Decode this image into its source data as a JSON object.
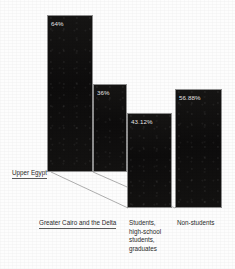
{
  "chart_data": {
    "type": "bar",
    "title": "",
    "subtitle": "",
    "xlabel": "",
    "ylabel": "",
    "grid": false,
    "legend": "none",
    "ylim": [
      0,
      70
    ],
    "categories": [
      "Upper Egypt",
      "Greater Cairo and the Delta",
      "Students, high-school students, graduates",
      "Non-students"
    ],
    "values": [
      64,
      36,
      43.12,
      56.88
    ],
    "value_labels": [
      "64%",
      "36%",
      "43.12%",
      "56.88%"
    ],
    "annotations": [
      "Upper Egypt and Greater Cairo and the Delta share a common baseline",
      "Students and Non-students share a common baseline"
    ]
  },
  "bars": [
    {
      "id": "upper-egypt",
      "value_label": "64%",
      "category": "Upper Egypt",
      "x": 47,
      "y": 15,
      "w": 46,
      "h": 157,
      "label_x": 51,
      "label_y": 20
    },
    {
      "id": "greater-cairo-delta",
      "value_label": "36%",
      "category": "Greater Cairo and the Delta",
      "x": 93,
      "y": 84,
      "w": 34,
      "h": 88,
      "label_x": 97,
      "label_y": 89
    },
    {
      "id": "students",
      "value_label": "43.12%",
      "category": "Students, high-school students, graduates",
      "x": 127,
      "y": 113,
      "w": 45,
      "h": 95,
      "label_x": 131,
      "label_y": 118
    },
    {
      "id": "non-students",
      "value_label": "56.88%",
      "category": "Non-students",
      "x": 175,
      "y": 89,
      "w": 47,
      "h": 119,
      "label_x": 179,
      "label_y": 94
    }
  ],
  "category_labels": [
    {
      "id": "upper-egypt",
      "text": "Upper Egypt",
      "x": 12,
      "y": 169,
      "underlined": true,
      "multiline": false
    },
    {
      "id": "greater-cairo-delta",
      "text": "Greater Cairo and the Delta",
      "x": 39,
      "y": 219,
      "underlined": true,
      "multiline": false
    },
    {
      "id": "students",
      "text": "Students, high-school students, graduates",
      "x": 129,
      "y": 219,
      "underlined": false,
      "multiline": true
    },
    {
      "id": "non-students",
      "text": "Non-students",
      "x": 177,
      "y": 219,
      "underlined": false,
      "multiline": false
    }
  ],
  "leader_lines": [
    {
      "id": "upper-egypt-leader",
      "x1": 51,
      "y1": 172,
      "x2": 128,
      "y2": 208
    },
    {
      "id": "greater-cairo-leader",
      "x1": 93,
      "y1": 172,
      "x2": 175,
      "y2": 208
    }
  ],
  "colors": {
    "bar_fill": "#111010",
    "bar_outline": "#8e8e8e",
    "value_text": "#eceaea",
    "category_text": "#2a2a2a",
    "leader_line": "#9a9a9a",
    "background": "#fdfdfd"
  }
}
